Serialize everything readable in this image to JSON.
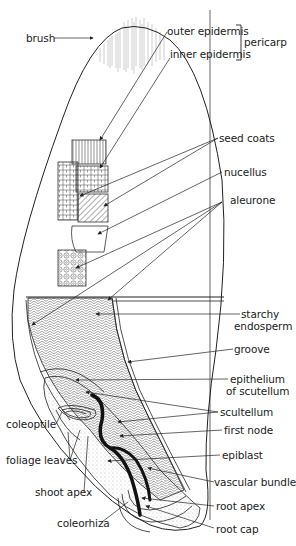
{
  "diagram": {
    "labels": {
      "brush": "brush",
      "outer_epidermis": "outer epidermis",
      "inner_epidermis": "inner epidermis",
      "pericarp": "pericarp",
      "seed_coats": "seed coats",
      "nucellus": "nucellus",
      "aleurone": "aleurone",
      "starchy_line1": "starchy",
      "starchy_line2": "endosperm",
      "groove": "groove",
      "epithelium_line1": "epithelium",
      "epithelium_line2": "of scutellum",
      "scutellum": "scultellum",
      "first_node": "first node",
      "coleoptile": "coleoptile",
      "foliage_leaves": "foliage leaves",
      "epiblast": "epiblast",
      "vascular_bundle": "vascular bundle",
      "shoot_apex": "shoot apex",
      "root_apex": "root apex",
      "coleorhiza": "coleorhiza",
      "root_cap": "root cap"
    },
    "groupings": [
      {
        "bracket": "pericarp",
        "members": [
          "outer epidermis",
          "inner epidermis"
        ]
      }
    ],
    "colors": {
      "line": "#222222",
      "fill": "#ffffff",
      "stipple": "#888888"
    }
  }
}
